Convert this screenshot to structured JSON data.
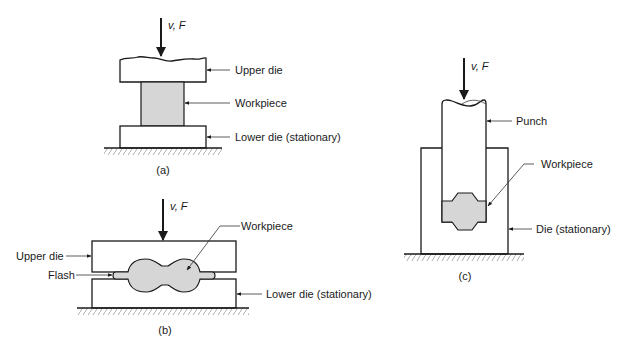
{
  "colors": {
    "line": "#1a1a1a",
    "workpiece_fill": "#d6d6d6",
    "background": "#ffffff"
  },
  "diagram": {
    "panels": [
      {
        "id": "a",
        "caption": "(a)",
        "force_label_v": "v,",
        "force_label_f": "F",
        "labels": {
          "upper_die": "Upper die",
          "workpiece": "Workpiece",
          "lower_die": "Lower die (stationary)"
        }
      },
      {
        "id": "b",
        "caption": "(b)",
        "force_label_v": "v,",
        "force_label_f": "F",
        "labels": {
          "upper_die": "Upper die",
          "flash": "Flash",
          "workpiece": "Workpiece",
          "lower_die": "Lower die (stationary)"
        }
      },
      {
        "id": "c",
        "caption": "(c)",
        "force_label_v": "v,",
        "force_label_f": "F",
        "labels": {
          "punch": "Punch",
          "workpiece": "Workpiece",
          "die": "Die (stationary)"
        }
      }
    ]
  }
}
